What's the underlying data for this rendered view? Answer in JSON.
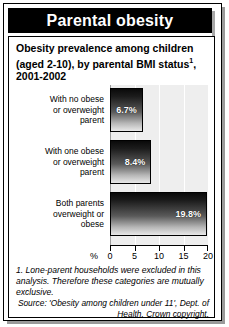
{
  "header": {
    "title": "Parental obesity"
  },
  "subtitle": {
    "line1": "Obesity prevalence among children",
    "line2_a": "(aged 2-10), by parental BMI status",
    "line2_sup": "1",
    "line2_b": ",",
    "line3": "2001-2002"
  },
  "footnote": {
    "text": "1. Lone-parent households were excluded in this analysis. Therefore these categories are mutually exclusive."
  },
  "source": {
    "text": "Source: 'Obesity among children under 11', Dept. of Health. Crown copyright."
  },
  "chart_data": {
    "type": "bar",
    "orientation": "horizontal",
    "categories": [
      "With no obese or overweight parent",
      "With one obese or overweight parent",
      "Both parents overweight or obese"
    ],
    "category_lines": [
      [
        "With no obese",
        "or overweight",
        "parent"
      ],
      [
        "With one obese",
        "or overweight",
        "parent"
      ],
      [
        "Both parents",
        "overweight or",
        "obese"
      ]
    ],
    "values": [
      6.7,
      8.4,
      19.8
    ],
    "value_labels": [
      "6.7%",
      "8.4%",
      "19.8%"
    ],
    "xlabel": "%",
    "ylabel": "",
    "xlim": [
      0,
      20
    ],
    "xticks": [
      0,
      5,
      10,
      15,
      20
    ],
    "xtick_labels": [
      "0",
      "5",
      "10",
      "15",
      "20"
    ],
    "grid": true,
    "legend": false
  }
}
